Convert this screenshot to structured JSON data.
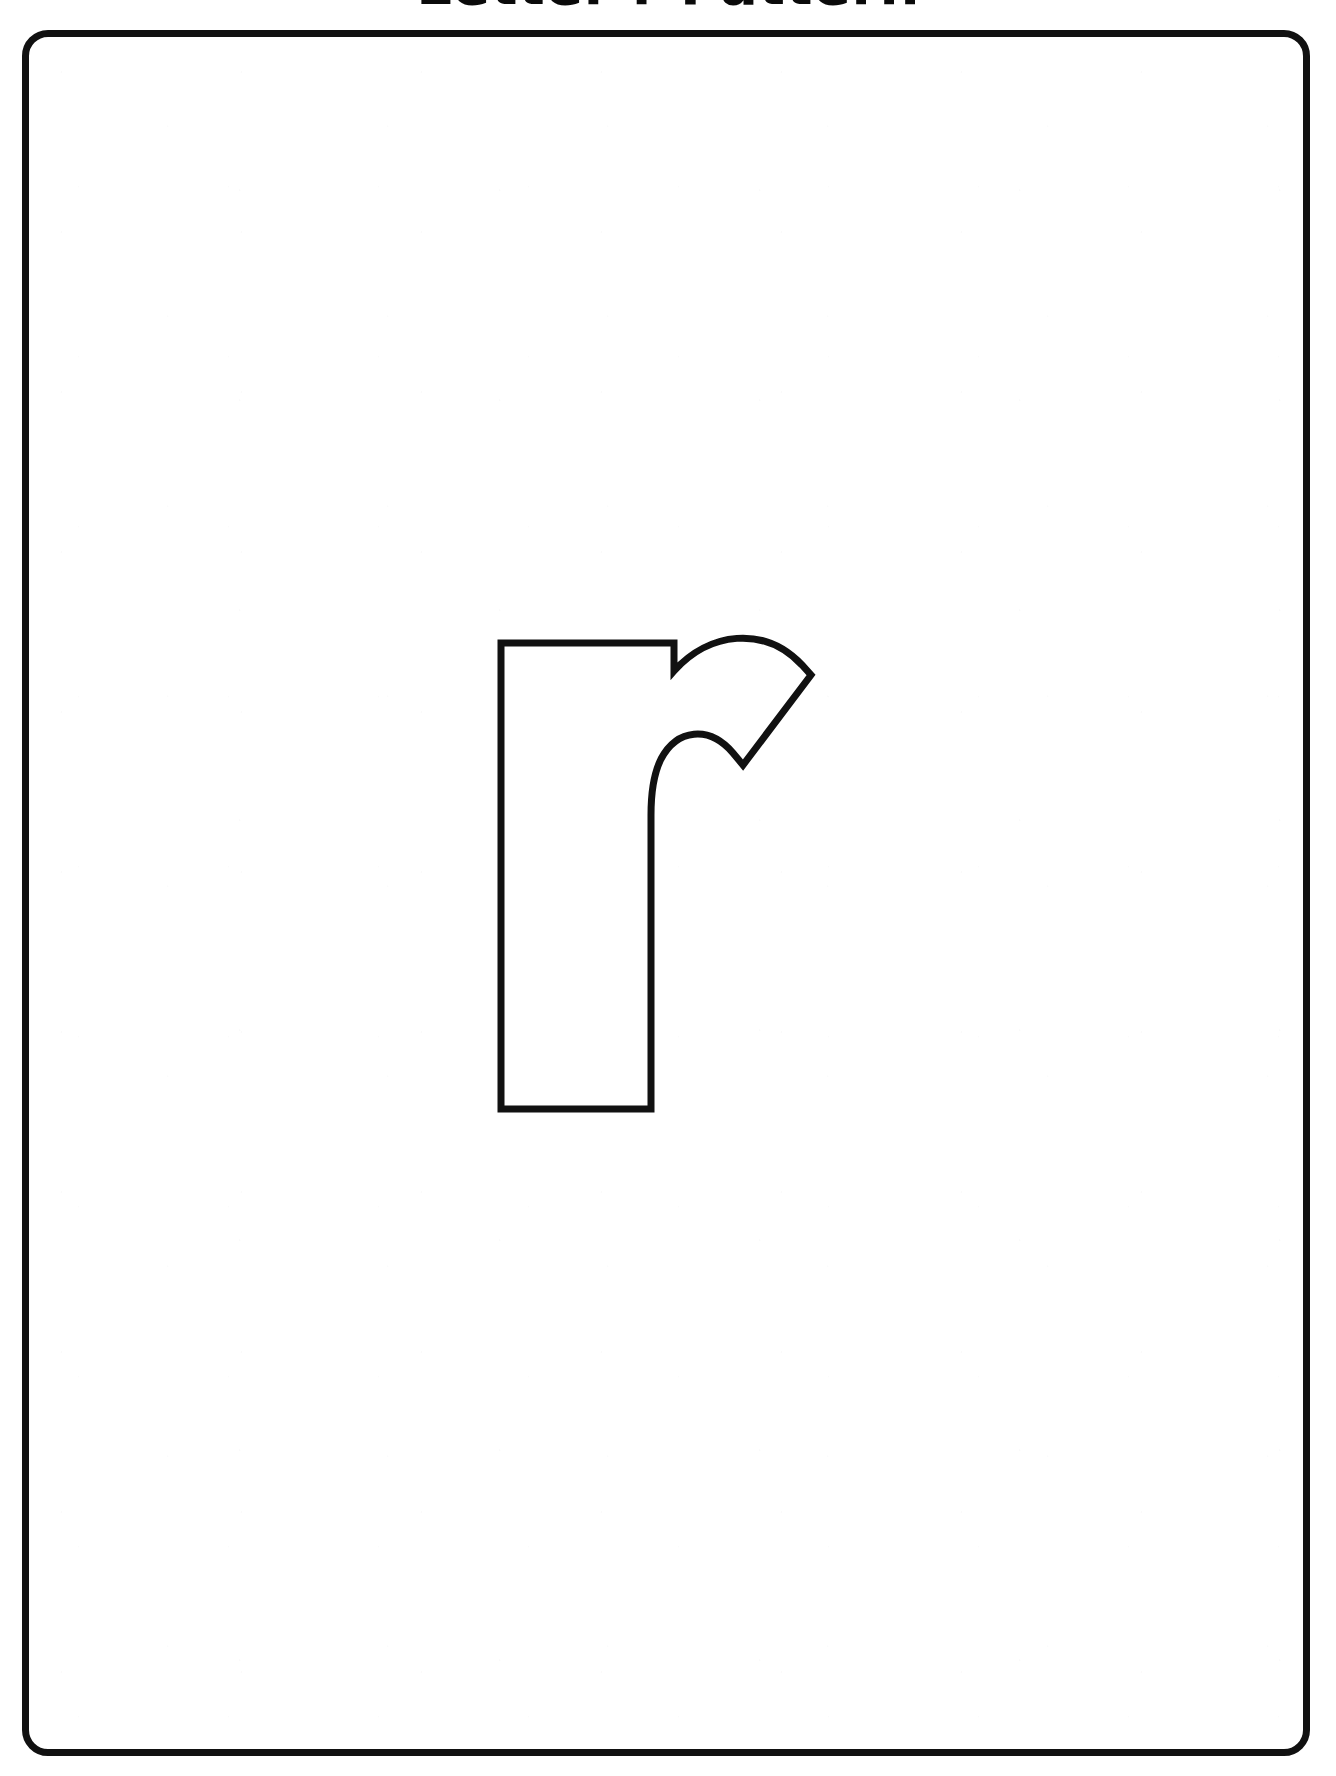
{
  "page": {
    "background_color": "#ffffff",
    "ink_color": "#111111",
    "width": 1336,
    "height": 1776
  },
  "title": {
    "text": "Letter r Pattern",
    "clipped_at_top": true
  },
  "frame": {
    "name": "sheet-border",
    "shape": "rounded-rectangle",
    "stroke_color": "#111111",
    "stroke_width": 7,
    "corner_radius": 26
  },
  "letter": {
    "character": "r",
    "case": "lowercase",
    "style": "outline",
    "fill_color": "#ffffff",
    "stroke_color": "#111111",
    "stroke_width": 7,
    "description": "Large hollow lowercase letter r outline for tracing, cutting or coloring"
  },
  "worksheet": {
    "type": "letter-pattern-template",
    "activity": "trace-cut-color"
  }
}
